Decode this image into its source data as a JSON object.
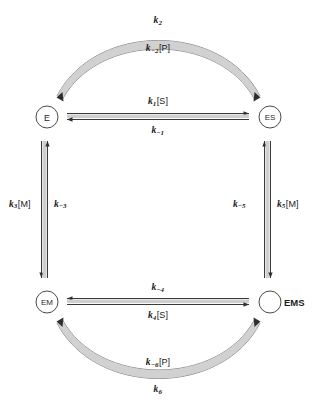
{
  "diagram": {
    "type": "reaction-scheme",
    "background_color": "#ffffff",
    "line_color": "#4a4a4a",
    "line_fill_color": "#c9c9c9",
    "text_color": "#1a1a1a",
    "nodes": [
      {
        "id": "E",
        "label": "E",
        "position": "top-left",
        "x": 47,
        "y": 117,
        "radius": 11,
        "label_inside": true
      },
      {
        "id": "ES",
        "label": "ES",
        "position": "top-right",
        "x": 270,
        "y": 117,
        "radius": 11,
        "label_inside": true
      },
      {
        "id": "EM",
        "label": "EM",
        "position": "bottom-left",
        "x": 47,
        "y": 302,
        "radius": 11,
        "label_inside": true
      },
      {
        "id": "EMS",
        "label": "EMS",
        "position": "bottom-right",
        "x": 270,
        "y": 302,
        "radius": 11,
        "label_inside": false
      }
    ],
    "edges": [
      {
        "id": "top-arc",
        "from": "E",
        "to": "ES",
        "shape": "arc-up",
        "reversible": true,
        "label_outer": "k2",
        "label_inner": "k-2[P]"
      },
      {
        "id": "top-horizontal",
        "from": "E",
        "to": "ES",
        "shape": "straight-horizontal",
        "reversible": true,
        "label_above": "k1[S]",
        "label_below": "k-1"
      },
      {
        "id": "left-vertical",
        "from": "E",
        "to": "EM",
        "shape": "straight-vertical",
        "reversible": true,
        "label_left": "k3[M]",
        "label_right": "k-3"
      },
      {
        "id": "right-vertical",
        "from": "ES",
        "to": "EMS",
        "shape": "straight-vertical",
        "reversible": true,
        "label_left": "k-5",
        "label_right": "k5[M]"
      },
      {
        "id": "bottom-horizontal",
        "from": "EM",
        "to": "EMS",
        "shape": "straight-horizontal",
        "reversible": true,
        "label_above": "k-4",
        "label_below": "k4[S]"
      },
      {
        "id": "bottom-arc",
        "from": "EM",
        "to": "EMS",
        "shape": "arc-down",
        "reversible": true,
        "label_inner": "k-6[P]",
        "label_outer": "k6"
      }
    ]
  },
  "labels": {
    "k2": {
      "base": "k",
      "sub": "2",
      "bracket": ""
    },
    "k_m2_P": {
      "base": "k",
      "sub": "−2",
      "bracket": "[P]"
    },
    "k1_S": {
      "base": "k",
      "sub": "1",
      "bracket": "[S]"
    },
    "k_m1": {
      "base": "k",
      "sub": "−1",
      "bracket": ""
    },
    "k3_M": {
      "base": "k",
      "sub": "3",
      "bracket": "[M]"
    },
    "k_m3": {
      "base": "k",
      "sub": "−3",
      "bracket": ""
    },
    "k_m5": {
      "base": "k",
      "sub": "−5",
      "bracket": ""
    },
    "k5_M": {
      "base": "k",
      "sub": "5",
      "bracket": "[M]"
    },
    "k_m4": {
      "base": "k",
      "sub": "−4",
      "bracket": ""
    },
    "k4_S": {
      "base": "k",
      "sub": "4",
      "bracket": "[S]"
    },
    "k_m6_P": {
      "base": "k",
      "sub": "−6",
      "bracket": "[P]"
    },
    "k6": {
      "base": "k",
      "sub": "6",
      "bracket": ""
    }
  },
  "nodes": {
    "E": "E",
    "ES": "ES",
    "EM": "EM",
    "EMS": "EMS"
  }
}
